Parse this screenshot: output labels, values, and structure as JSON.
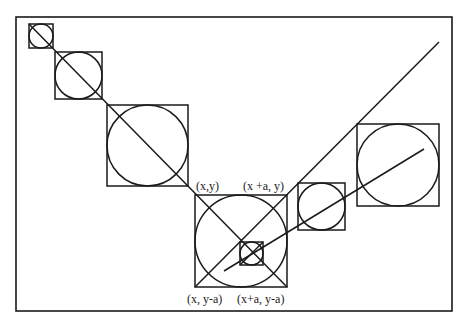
{
  "diagram": {
    "frame": {
      "x": 16,
      "y": 17,
      "w": 436,
      "h": 294
    },
    "stroke_color": "#1a1a1a",
    "squares": [
      {
        "id": "s1",
        "x": 29,
        "y": 24,
        "size": 24
      },
      {
        "id": "s2",
        "x": 55,
        "y": 52,
        "size": 47
      },
      {
        "id": "s3",
        "x": 107,
        "y": 105,
        "size": 81
      },
      {
        "id": "s4",
        "x": 195,
        "y": 195,
        "size": 92
      },
      {
        "id": "s5",
        "x": 298,
        "y": 183,
        "size": 47
      },
      {
        "id": "s6",
        "x": 357,
        "y": 124,
        "size": 82
      },
      {
        "id": "s7",
        "x": 240,
        "y": 242,
        "size": 23
      }
    ],
    "lines": [
      {
        "id": "diag-main",
        "x1": 29,
        "y1": 24,
        "x2": 287,
        "y2": 287
      },
      {
        "id": "diag-up",
        "x1": 195,
        "y1": 287,
        "x2": 439,
        "y2": 42
      },
      {
        "id": "diag-shallow",
        "x1": 224,
        "y1": 271,
        "x2": 424,
        "y2": 149
      }
    ],
    "labels": {
      "top_left": "(x,y)",
      "top_right": "(x +a, y)",
      "bottom_left": "(x, y-a)",
      "bottom_right": "(x+a, y-a)"
    }
  }
}
